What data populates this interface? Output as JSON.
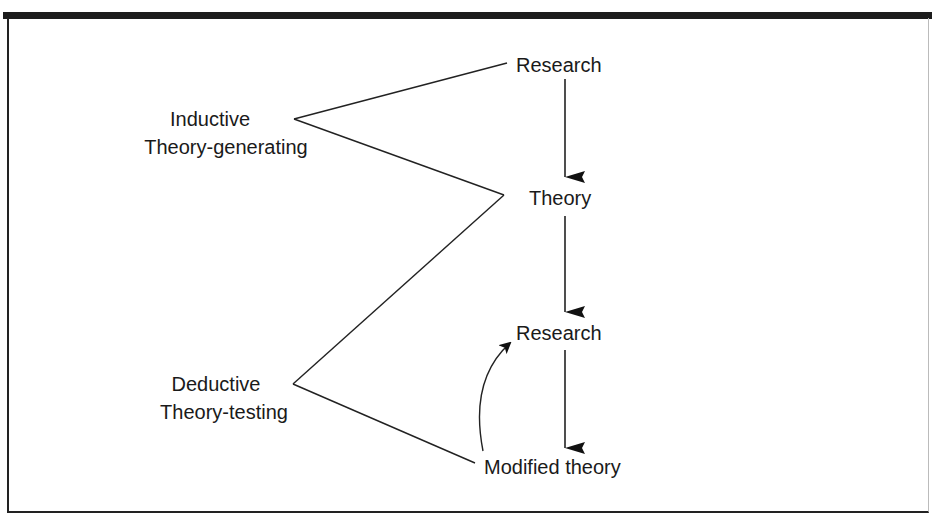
{
  "diagram": {
    "nodes": {
      "research_top": "Research",
      "theory": "Theory",
      "research_mid": "Research",
      "modified_theory": "Modified theory"
    },
    "approaches": {
      "inductive": {
        "line1": "Inductive",
        "line2": "Theory-generating"
      },
      "deductive": {
        "line1": "Deductive",
        "line2": "Theory-testing"
      }
    },
    "edges": [
      {
        "from": "Research",
        "to": "Theory",
        "type": "arrow"
      },
      {
        "from": "Theory",
        "to": "Research",
        "type": "arrow"
      },
      {
        "from": "Research",
        "to": "Modified theory",
        "type": "arrow"
      },
      {
        "from": "Modified theory",
        "to": "Research",
        "type": "curved-arrow"
      }
    ],
    "colors": {
      "line": "#1a1a1a",
      "background": "#ffffff"
    }
  }
}
